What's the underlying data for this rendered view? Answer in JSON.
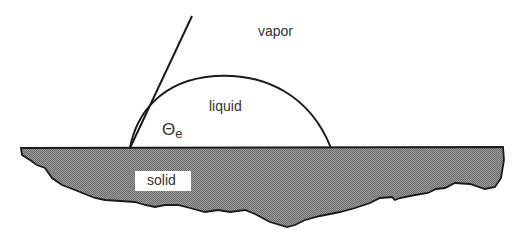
{
  "diagram": {
    "labels": {
      "vapor": "vapor",
      "liquid": "liquid",
      "theta": "Θ",
      "theta_sub": "e",
      "solid": "solid"
    },
    "colors": {
      "line": "#1a1a1a",
      "solid_fill": "#8a8a8a",
      "background": "#ffffff"
    },
    "geometry": {
      "substrate_top_y": 147,
      "drop_left_x": 130,
      "drop_right_x": 330,
      "tangent_top": [
        192,
        16
      ]
    }
  }
}
